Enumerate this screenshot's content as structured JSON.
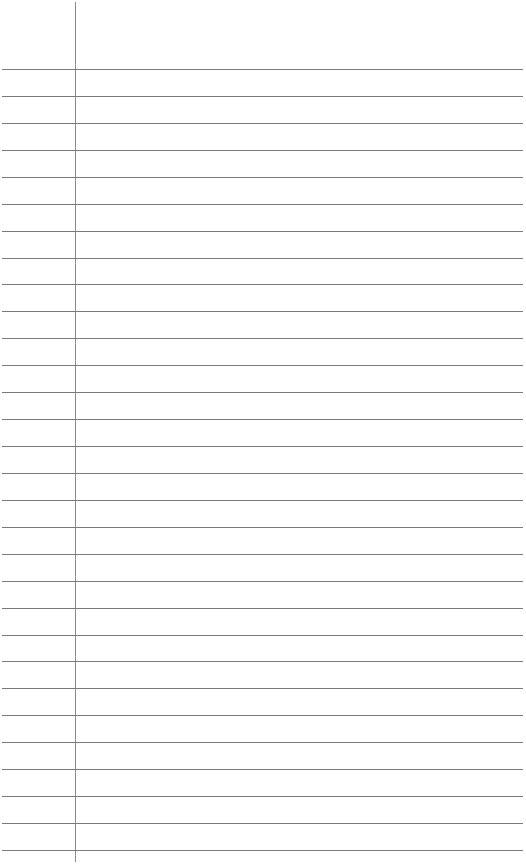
{
  "page": {
    "type": "lined-notebook-page",
    "background_color": "#ffffff",
    "line_color": "#7a7a7a",
    "margin_line_color": "#8a8a8a",
    "margin_x": 75,
    "first_rule_y": 69,
    "rule_spacing": 26.93,
    "rule_count": 30
  }
}
